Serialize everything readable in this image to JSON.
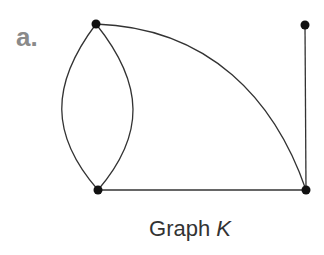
{
  "figure": {
    "panel_label": "a.",
    "caption_prefix": "Graph ",
    "caption_var": "K"
  },
  "graph": {
    "name": "K",
    "vertices": [
      {
        "id": "v1",
        "x": 96,
        "y": 24
      },
      {
        "id": "v2",
        "x": 305,
        "y": 25
      },
      {
        "id": "v3",
        "x": 98,
        "y": 190
      },
      {
        "id": "v4",
        "x": 306,
        "y": 190
      }
    ],
    "edges": [
      {
        "from": "v1",
        "to": "v3",
        "shape": "curve-left"
      },
      {
        "from": "v1",
        "to": "v3",
        "shape": "curve-right"
      },
      {
        "from": "v1",
        "to": "v4",
        "shape": "arc"
      },
      {
        "from": "v2",
        "to": "v4",
        "shape": "line"
      },
      {
        "from": "v3",
        "to": "v4",
        "shape": "line"
      }
    ],
    "colors": {
      "edge": "#333333",
      "vertex": "#111111",
      "label": "#8a8a8a"
    }
  }
}
